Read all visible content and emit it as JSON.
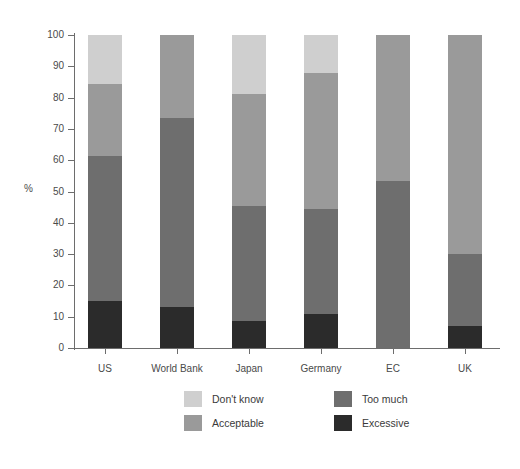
{
  "chart_data": {
    "type": "bar",
    "subtype": "stacked-bar-100",
    "title": "",
    "xlabel": "",
    "ylabel": "%",
    "ylim": [
      0,
      100
    ],
    "ytick_step": 10,
    "grid": false,
    "legend_position": "bottom",
    "categories": [
      "US",
      "World Bank",
      "Japan",
      "Germany",
      "EC",
      "UK"
    ],
    "series": [
      {
        "name": "Excessive",
        "color": "#2b2b2b",
        "values": [
          15,
          13,
          8.5,
          11,
          0,
          7
        ]
      },
      {
        "name": "Too much",
        "color": "#6e6e6e",
        "values": [
          46.5,
          60.5,
          37,
          33.5,
          53.5,
          23
        ]
      },
      {
        "name": "Acceptable",
        "color": "#9a9a9a",
        "values": [
          23,
          26.5,
          35.5,
          43.5,
          46.5,
          70
        ]
      },
      {
        "name": "Don't know",
        "color": "#cfcfcf",
        "values": [
          15.5,
          0,
          19,
          12,
          0,
          0
        ]
      }
    ],
    "stack_order_bottom_to_top": [
      "Excessive",
      "Too much",
      "Acceptable",
      "Don't know"
    ],
    "ytick_labels": [
      "0",
      "10",
      "20",
      "30",
      "40",
      "50",
      "60",
      "70",
      "80",
      "90",
      "100"
    ],
    "cumulative_boundaries": {
      "US": {
        "excessive_top": 15,
        "too_much_top": 61.5,
        "acceptable_top": 84.5,
        "dont_know_top": 100
      },
      "World Bank": {
        "excessive_top": 13,
        "too_much_top": 73.5,
        "acceptable_top": 100,
        "dont_know_top": 100
      },
      "Japan": {
        "excessive_top": 8.5,
        "too_much_top": 45.5,
        "acceptable_top": 81,
        "dont_know_top": 100
      },
      "Germany": {
        "excessive_top": 11,
        "too_much_top": 44.5,
        "acceptable_top": 88,
        "dont_know_top": 100
      },
      "EC": {
        "excessive_top": 0,
        "too_much_top": 53.5,
        "acceptable_top": 100,
        "dont_know_top": 100
      },
      "UK": {
        "excessive_top": 7,
        "too_much_top": 30,
        "acceptable_top": 100,
        "dont_know_top": 100
      }
    }
  },
  "legend": {
    "items": [
      {
        "label": "Don't know",
        "color": "#cfcfcf",
        "col": 0,
        "row": 0
      },
      {
        "label": "Too much",
        "color": "#6e6e6e",
        "col": 1,
        "row": 0
      },
      {
        "label": "Acceptable",
        "color": "#9a9a9a",
        "col": 0,
        "row": 1
      },
      {
        "label": "Excessive",
        "color": "#2b2b2b",
        "col": 1,
        "row": 1
      }
    ]
  },
  "colors": {
    "axis": "#6d6d6d",
    "text": "#3a3a3a",
    "background": "#ffffff"
  }
}
